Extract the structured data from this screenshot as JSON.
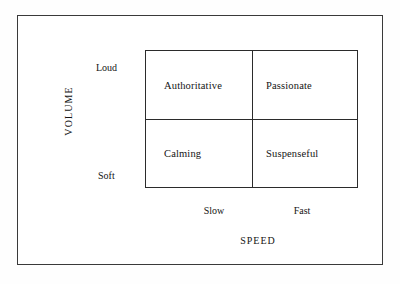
{
  "chart_data": {
    "type": "table",
    "title": "",
    "xlabel": "SPEED",
    "ylabel": "VOLUME",
    "x_categories": [
      "Slow",
      "Fast"
    ],
    "y_categories": [
      "Loud",
      "Soft"
    ],
    "grid": true,
    "legend": "none",
    "cells": [
      {
        "row": "Loud",
        "column": "Slow",
        "label": "Authoritative"
      },
      {
        "row": "Loud",
        "column": "Fast",
        "label": "Passionate"
      },
      {
        "row": "Soft",
        "column": "Slow",
        "label": "Calming"
      },
      {
        "row": "Soft",
        "column": "Fast",
        "label": "Suspenseful"
      }
    ],
    "colors": {
      "background": "#ffffff",
      "line": "#2b2b2b",
      "frame": "#3a3a3a",
      "text": "#141414"
    }
  },
  "diagram": {
    "quadrants": {
      "top_left": "Authoritative",
      "top_right": "Passionate",
      "bottom_left": "Calming",
      "bottom_right": "Suspenseful"
    },
    "y_axis": {
      "title": "VOLUME",
      "high": "Loud",
      "low": "Soft"
    },
    "x_axis": {
      "title": "SPEED",
      "low": "Slow",
      "high": "Fast"
    }
  }
}
